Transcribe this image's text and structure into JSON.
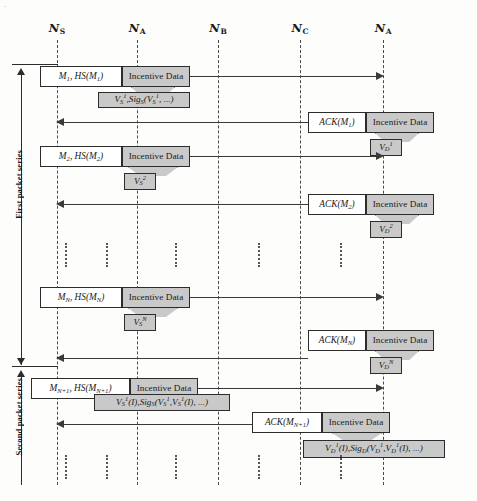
{
  "figure": {
    "corner_mark": "."
  },
  "lifelines": [
    {
      "name": "N_S",
      "base": "N",
      "sub": "S",
      "x": 57
    },
    {
      "name": "N_A",
      "base": "N",
      "sub": "A",
      "x": 137
    },
    {
      "name": "N_B",
      "base": "N",
      "sub": "B",
      "x": 218
    },
    {
      "name": "N_C",
      "base": "N",
      "sub": "C",
      "x": 300
    },
    {
      "name": "N_A_dest",
      "base": "N",
      "sub": "A",
      "x": 383
    }
  ],
  "series": [
    {
      "id": "first",
      "label": "First packet series"
    },
    {
      "id": "second",
      "label": "Second packet series"
    }
  ],
  "messages": [
    {
      "id": "m1",
      "direction": "forward",
      "label": "M₁, HS(M₁)",
      "label_parts": {
        "m": "M",
        "m_sub": "1",
        "hs": "HS(M",
        "hs_sub": "1",
        "hs_close": ")"
      },
      "incentive": "Incentive Data",
      "callout": "V_S^1 , Sig_S(V_S^1, ...)",
      "callout_parts": {
        "v": "V",
        "v_sub": "S",
        "v_sup": "1",
        "sig": "Sig",
        "sig_sub": "S",
        "tail": ", ...)"
      }
    },
    {
      "id": "ack1",
      "direction": "backward",
      "label": "ACK(M₁)",
      "label_parts": {
        "ack": "ACK(M",
        "ack_sub": "1",
        "close": ")"
      },
      "incentive": "Incentive Data",
      "callout": "V_D^1",
      "callout_parts": {
        "v": "V",
        "v_sub": "D",
        "v_sup": "1"
      }
    },
    {
      "id": "m2",
      "direction": "forward",
      "label": "M₂, HS(M₂)",
      "label_parts": {
        "m": "M",
        "m_sub": "2",
        "hs": "HS(M",
        "hs_sub": "2",
        "hs_close": ")"
      },
      "incentive": "Incentive Data",
      "callout": "V_S^2",
      "callout_parts": {
        "v": "V",
        "v_sub": "S",
        "v_sup": "2"
      }
    },
    {
      "id": "ack2",
      "direction": "backward",
      "label": "ACK(M₂)",
      "label_parts": {
        "ack": "ACK(M",
        "ack_sub": "2",
        "close": ")"
      },
      "incentive": "Incentive Data",
      "callout": "V_D^2",
      "callout_parts": {
        "v": "V",
        "v_sub": "D",
        "v_sup": "2"
      }
    },
    {
      "id": "mN",
      "direction": "forward",
      "label": "Mₙ, HS(Mₙ)",
      "label_parts": {
        "m": "M",
        "m_sub": "N",
        "hs": "HS(M",
        "hs_sub": "N",
        "hs_close": ")"
      },
      "incentive": "Incentive Data",
      "callout": "V_S^N",
      "callout_parts": {
        "v": "V",
        "v_sub": "S",
        "v_sup": "N"
      }
    },
    {
      "id": "ackN",
      "direction": "backward",
      "label": "ACK(Mₙ)",
      "label_parts": {
        "ack": "ACK(M",
        "ack_sub": "N",
        "close": ")"
      },
      "incentive": "Incentive Data",
      "callout": "V_D^N",
      "callout_parts": {
        "v": "V",
        "v_sub": "D",
        "v_sup": "N"
      }
    },
    {
      "id": "mN1",
      "direction": "forward",
      "label": "Mₙ₊₁, HS(Mₙ₊₁)",
      "label_parts": {
        "m": "M",
        "m_sub": "N+1",
        "hs": "HS(M",
        "hs_sub": "N+1",
        "hs_close": ")"
      },
      "incentive": "Incentive Data",
      "callout": "V_S^1(I), Sig_S(V_S^1, V_S^1(I), ...)",
      "callout_parts": {
        "v": "V",
        "v_sub": "S",
        "v_sup": "1",
        "paren": "(I), ",
        "sig": "Sig",
        "sig_sub": "S",
        "tail": "(I), ...)"
      }
    },
    {
      "id": "ackN1",
      "direction": "backward",
      "label": "ACK(Mₙ₊₁)",
      "label_parts": {
        "ack": "ACK(M",
        "ack_sub": "N+1",
        "close": ")"
      },
      "incentive": "Incentive Data",
      "callout": "V_D^1(I), Sig_D(V_D^1, V_D^1(I), ...)",
      "callout_parts": {
        "v": "V",
        "v_sub": "D",
        "v_sup": "1",
        "paren": "(I), ",
        "sig": "Sig",
        "sig_sub": "D",
        "tail": "(I), ...)"
      }
    }
  ],
  "labels": {
    "incentive_data": "Incentive Data"
  }
}
